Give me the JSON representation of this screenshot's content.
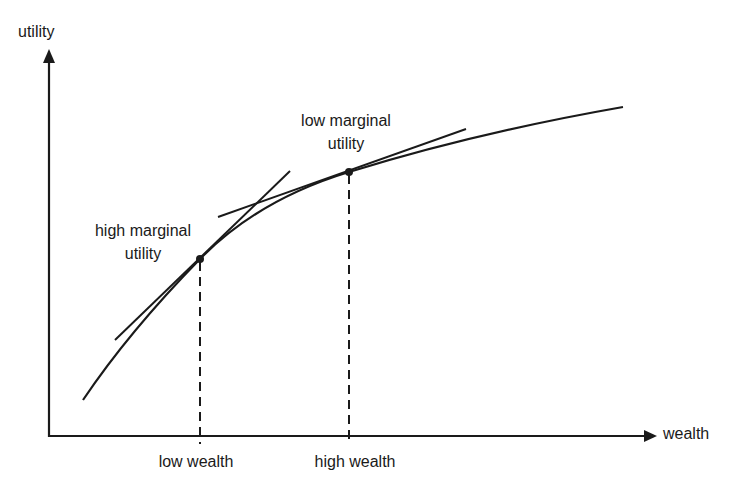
{
  "diagram": {
    "type": "concave-utility-function",
    "axes": {
      "y_label": "utility",
      "x_label": "wealth"
    },
    "annotations": {
      "high_mu_line1": "high marginal",
      "high_mu_line2": "utility",
      "low_mu_line1": "low marginal",
      "low_mu_line2": "utility"
    },
    "x_ticks": {
      "low": "low wealth",
      "high": "high wealth"
    },
    "colors": {
      "ink": "#1a1a1a",
      "background": "#ffffff"
    }
  }
}
